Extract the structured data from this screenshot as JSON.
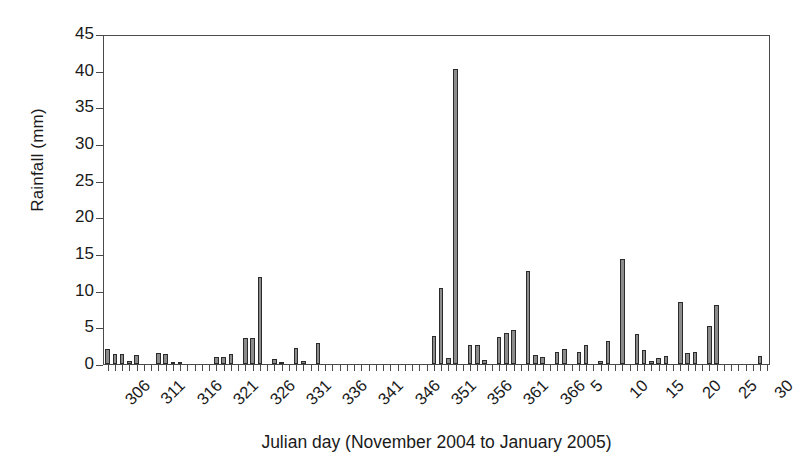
{
  "chart_data": {
    "type": "bar",
    "title": "",
    "xlabel": "Julian day (November 2004 to January 2005)",
    "ylabel": "Rainfall (mm)",
    "ylim": [
      0,
      45
    ],
    "yticks": [
      0,
      5,
      10,
      15,
      20,
      25,
      30,
      35,
      40,
      45
    ],
    "grid": false,
    "legend": null,
    "xtick_labels": [
      "306",
      "311",
      "316",
      "321",
      "326",
      "331",
      "336",
      "341",
      "346",
      "351",
      "356",
      "361",
      "366",
      "5",
      "10",
      "15",
      "20",
      "25",
      "30"
    ],
    "xtick_days": [
      306,
      311,
      316,
      321,
      326,
      331,
      336,
      341,
      346,
      351,
      356,
      361,
      366,
      371,
      376,
      381,
      386,
      391,
      396
    ],
    "x_note": "Julian days 306-366 are Nov 1 2004 - Dec 31 2004; subsequent labels 5,10,15,20,25,30 are January 2005 days (plot index 371=Jan 5 ... 396=Jan 30)",
    "categories": [
      306,
      307,
      308,
      309,
      310,
      311,
      312,
      313,
      314,
      315,
      316,
      317,
      318,
      319,
      320,
      321,
      322,
      323,
      324,
      325,
      326,
      327,
      328,
      329,
      330,
      331,
      332,
      333,
      334,
      335,
      336,
      337,
      338,
      339,
      340,
      341,
      342,
      343,
      344,
      345,
      346,
      347,
      348,
      349,
      350,
      351,
      352,
      353,
      354,
      355,
      356,
      357,
      358,
      359,
      360,
      361,
      362,
      363,
      364,
      365,
      366,
      367,
      368,
      369,
      370,
      371,
      372,
      373,
      374,
      375,
      376,
      377,
      378,
      379,
      380,
      381,
      382,
      383,
      384,
      385,
      386,
      387,
      388,
      389,
      390,
      391,
      392,
      393,
      394,
      395,
      396,
      397
    ],
    "values": [
      2.0,
      1.3,
      1.4,
      0.4,
      1.2,
      0.0,
      0.0,
      1.5,
      1.4,
      0.3,
      0.2,
      0.0,
      0.0,
      0.0,
      0.0,
      0.9,
      1.0,
      1.3,
      0.0,
      3.6,
      3.5,
      11.8,
      0.0,
      0.7,
      0.2,
      0.0,
      2.2,
      0.4,
      0.0,
      2.9,
      0.0,
      0.0,
      0.0,
      0.0,
      0.0,
      0.0,
      0.0,
      0.0,
      0.0,
      0.0,
      0.0,
      0.0,
      0.0,
      0.0,
      0.0,
      3.8,
      10.4,
      0.8,
      40.2,
      0.0,
      2.6,
      2.6,
      0.6,
      0.0,
      3.7,
      4.2,
      4.7,
      0.0,
      12.7,
      1.2,
      0.9,
      0.0,
      1.7,
      2.1,
      0.0,
      1.6,
      2.6,
      0.0,
      0.4,
      3.2,
      0.0,
      14.3,
      0.0,
      4.1,
      1.9,
      0.4,
      0.8,
      1.1,
      0.0,
      8.5,
      1.5,
      1.7,
      0.0,
      5.2,
      8.1,
      0.0,
      0.0,
      0.0,
      0.0,
      0.0,
      1.1,
      0.0
    ],
    "notable_points": [
      {
        "day": 354,
        "value": 40.2,
        "note": "largest single-day rainfall"
      },
      {
        "day": 352,
        "value": 10.4
      },
      {
        "day": 327,
        "value": 11.8
      },
      {
        "day": 364,
        "value": 12.7
      },
      {
        "day": 377,
        "value": 14.3
      },
      {
        "day": 385,
        "value": 8.5
      },
      {
        "day": 390,
        "value": 8.1
      },
      {
        "day": 389,
        "value": 5.2
      }
    ],
    "bar_color": "#8c8c8c",
    "bar_edge_color": "#2b2b2b",
    "axis_color": "#4a4a4a"
  }
}
